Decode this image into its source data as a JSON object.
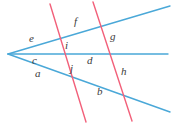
{
  "figure": {
    "name": "angle-labels-geometry-figure",
    "width": 171,
    "height": 127,
    "background": "#ffffff"
  },
  "colors": {
    "blue_line": "#4aa8d8",
    "pink_line": "#f2607a",
    "label_text": "#3b3b3b"
  },
  "lines": {
    "blue": [
      {
        "name": "upper-ray",
        "x1": 8,
        "y1": 54,
        "x2": 170,
        "y2": 6,
        "color": "#4aa8d8",
        "width": 1.4
      },
      {
        "name": "middle-horizontal-ray",
        "x1": 8,
        "y1": 54,
        "x2": 168,
        "y2": 54,
        "color": "#4aa8d8",
        "width": 1.4
      },
      {
        "name": "lower-ray",
        "x1": 8,
        "y1": 54,
        "x2": 170,
        "y2": 112,
        "color": "#4aa8d8",
        "width": 1.4
      }
    ],
    "pink": [
      {
        "name": "left-transversal",
        "x1": 50,
        "y1": 4,
        "x2": 86,
        "y2": 122,
        "color": "#f2607a",
        "width": 1.4
      },
      {
        "name": "right-transversal",
        "x1": 93,
        "y1": 2,
        "x2": 132,
        "y2": 121,
        "color": "#f2607a",
        "width": 1.4
      }
    ]
  },
  "labels": [
    {
      "id": "e",
      "text": "e",
      "x": 29,
      "y": 33
    },
    {
      "id": "f",
      "text": "f",
      "x": 74,
      "y": 16
    },
    {
      "id": "g",
      "text": "g",
      "x": 110,
      "y": 31
    },
    {
      "id": "i",
      "text": "i",
      "x": 65,
      "y": 40
    },
    {
      "id": "c",
      "text": "c",
      "x": 32,
      "y": 55
    },
    {
      "id": "d",
      "text": "d",
      "x": 87,
      "y": 55
    },
    {
      "id": "j",
      "text": "j",
      "x": 70,
      "y": 63
    },
    {
      "id": "a",
      "text": "a",
      "x": 35,
      "y": 68
    },
    {
      "id": "h",
      "text": "h",
      "x": 121,
      "y": 66
    },
    {
      "id": "b",
      "text": "b",
      "x": 97,
      "y": 86
    }
  ]
}
